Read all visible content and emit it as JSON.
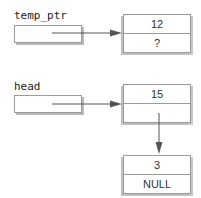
{
  "pointers": [
    {
      "name": "temp_ptr"
    },
    {
      "name": "head"
    }
  ],
  "nodes": [
    {
      "data": "12",
      "next": "?"
    },
    {
      "data": "15",
      "next": ""
    },
    {
      "data": "3",
      "next": "NULL"
    }
  ],
  "colors": {
    "border": "#9a9a9a",
    "arrow": "#555555",
    "shadow": "#b8b8b8"
  }
}
